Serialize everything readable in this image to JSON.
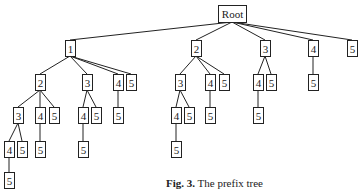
{
  "figure": {
    "caption_label": "Fig. 3.",
    "caption_text": "The prefix tree",
    "line_color": "#222222",
    "background": "#ffffff"
  },
  "tree": {
    "nodes": [
      {
        "id": "root",
        "label": "Root",
        "x": 218,
        "y": 5,
        "w": 28,
        "h": 17
      },
      {
        "id": "n1",
        "label": "1",
        "x": 65,
        "y": 40,
        "w": 10,
        "h": 16
      },
      {
        "id": "n2",
        "label": "2",
        "x": 191,
        "y": 40,
        "w": 10,
        "h": 16
      },
      {
        "id": "n3",
        "label": "3",
        "x": 260,
        "y": 40,
        "w": 10,
        "h": 16
      },
      {
        "id": "n4",
        "label": "4",
        "x": 308,
        "y": 40,
        "w": 10,
        "h": 16
      },
      {
        "id": "n5",
        "label": "5",
        "x": 347,
        "y": 40,
        "w": 10,
        "h": 16
      },
      {
        "id": "n12",
        "label": "2",
        "x": 35,
        "y": 74,
        "w": 10,
        "h": 16
      },
      {
        "id": "n13",
        "label": "3",
        "x": 82,
        "y": 74,
        "w": 10,
        "h": 16
      },
      {
        "id": "n14",
        "label": "4",
        "x": 113,
        "y": 74,
        "w": 10,
        "h": 16
      },
      {
        "id": "n15",
        "label": "5",
        "x": 126,
        "y": 74,
        "w": 10,
        "h": 16
      },
      {
        "id": "n23",
        "label": "3",
        "x": 175,
        "y": 74,
        "w": 10,
        "h": 16
      },
      {
        "id": "n24",
        "label": "4",
        "x": 205,
        "y": 74,
        "w": 10,
        "h": 16
      },
      {
        "id": "n25",
        "label": "5",
        "x": 219,
        "y": 74,
        "w": 10,
        "h": 16
      },
      {
        "id": "n34",
        "label": "4",
        "x": 253,
        "y": 74,
        "w": 10,
        "h": 16
      },
      {
        "id": "n35",
        "label": "5",
        "x": 266,
        "y": 74,
        "w": 10,
        "h": 16
      },
      {
        "id": "n45",
        "label": "5",
        "x": 308,
        "y": 74,
        "w": 10,
        "h": 16
      },
      {
        "id": "n123",
        "label": "3",
        "x": 13,
        "y": 107,
        "w": 10,
        "h": 16
      },
      {
        "id": "n124",
        "label": "4",
        "x": 35,
        "y": 107,
        "w": 10,
        "h": 16
      },
      {
        "id": "n125",
        "label": "5",
        "x": 49,
        "y": 107,
        "w": 10,
        "h": 16
      },
      {
        "id": "n134",
        "label": "4",
        "x": 78,
        "y": 107,
        "w": 10,
        "h": 16
      },
      {
        "id": "n135",
        "label": "5",
        "x": 91,
        "y": 107,
        "w": 10,
        "h": 16
      },
      {
        "id": "n145",
        "label": "5",
        "x": 113,
        "y": 107,
        "w": 10,
        "h": 16
      },
      {
        "id": "n234",
        "label": "4",
        "x": 171,
        "y": 107,
        "w": 10,
        "h": 16
      },
      {
        "id": "n235",
        "label": "5",
        "x": 184,
        "y": 107,
        "w": 10,
        "h": 16
      },
      {
        "id": "n245",
        "label": "5",
        "x": 205,
        "y": 107,
        "w": 10,
        "h": 16
      },
      {
        "id": "n345",
        "label": "5",
        "x": 253,
        "y": 107,
        "w": 10,
        "h": 16
      },
      {
        "id": "n1234",
        "label": "4",
        "x": 4,
        "y": 141,
        "w": 10,
        "h": 16
      },
      {
        "id": "n1235",
        "label": "5",
        "x": 17,
        "y": 141,
        "w": 10,
        "h": 16
      },
      {
        "id": "n1245",
        "label": "5",
        "x": 35,
        "y": 141,
        "w": 10,
        "h": 16
      },
      {
        "id": "n1345",
        "label": "5",
        "x": 78,
        "y": 141,
        "w": 10,
        "h": 16
      },
      {
        "id": "n2345",
        "label": "5",
        "x": 171,
        "y": 141,
        "w": 10,
        "h": 16
      },
      {
        "id": "n12345",
        "label": "5",
        "x": 4,
        "y": 172,
        "w": 10,
        "h": 16
      }
    ],
    "edges": [
      [
        "root",
        "n1"
      ],
      [
        "root",
        "n2"
      ],
      [
        "root",
        "n3"
      ],
      [
        "root",
        "n4"
      ],
      [
        "root",
        "n5"
      ],
      [
        "n1",
        "n12"
      ],
      [
        "n1",
        "n13"
      ],
      [
        "n1",
        "n14"
      ],
      [
        "n1",
        "n15"
      ],
      [
        "n2",
        "n23"
      ],
      [
        "n2",
        "n24"
      ],
      [
        "n2",
        "n25"
      ],
      [
        "n3",
        "n34"
      ],
      [
        "n3",
        "n35"
      ],
      [
        "n4",
        "n45"
      ],
      [
        "n12",
        "n123"
      ],
      [
        "n12",
        "n124"
      ],
      [
        "n12",
        "n125"
      ],
      [
        "n13",
        "n134"
      ],
      [
        "n13",
        "n135"
      ],
      [
        "n14",
        "n145"
      ],
      [
        "n23",
        "n234"
      ],
      [
        "n23",
        "n235"
      ],
      [
        "n24",
        "n245"
      ],
      [
        "n34",
        "n345"
      ],
      [
        "n123",
        "n1234"
      ],
      [
        "n123",
        "n1235"
      ],
      [
        "n124",
        "n1245"
      ],
      [
        "n134",
        "n1345"
      ],
      [
        "n234",
        "n2345"
      ],
      [
        "n1234",
        "n12345"
      ]
    ]
  }
}
